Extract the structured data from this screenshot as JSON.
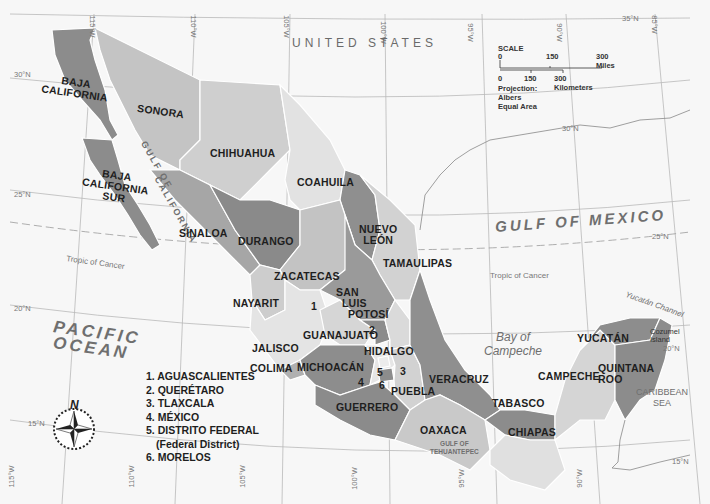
{
  "map": {
    "country_label": "UNITED STATES",
    "water_bodies": {
      "pacific": "PACIFIC OCEAN",
      "pacific_line1": "PACIFIC",
      "pacific_line2": "OCEAN",
      "gulf_mexico": "GULF OF MEXICO",
      "gulf_california_1": "GULF OF",
      "gulf_california_2": "CALIFORNIA",
      "bay_campeche_1": "Bay of",
      "bay_campeche_2": "Campeche",
      "caribbean_1": "CARIBBEAN",
      "caribbean_2": "SEA",
      "tehuantepec_1": "GULF OF",
      "tehuantepec_2": "TEHUANTEPEC",
      "yucatan_channel": "Yucatán Channel",
      "cozumel_1": "Cozumel",
      "cozumel_2": "Island"
    },
    "states": {
      "baja_california_1": "BAJA",
      "baja_california_2": "CALIFORNIA",
      "baja_california_sur_1": "BAJA",
      "baja_california_sur_2": "CALIFORNIA",
      "baja_california_sur_3": "SUR",
      "sonora": "SONORA",
      "chihuahua": "CHIHUAHUA",
      "coahuila": "COAHUILA",
      "nuevo_leon_1": "NUEVO",
      "nuevo_leon_2": "LEÓN",
      "tamaulipas": "TAMAULIPAS",
      "sinaloa": "SINALOA",
      "durango": "DURANGO",
      "zacatecas": "ZACATECAS",
      "san_luis_potosi_1": "SAN",
      "san_luis_potosi_2": "LUIS",
      "san_luis_potosi_3": "POTOSÍ",
      "nayarit": "NAYARIT",
      "jalisco": "JALISCO",
      "colima": "COLIMA",
      "guanajuato": "GUANAJUATO",
      "hidalgo": "HIDALGO",
      "michoacan": "MICHOACÁN",
      "veracruz": "VERACRUZ",
      "puebla": "PUEBLA",
      "guerrero": "GUERRERO",
      "oaxaca": "OAXACA",
      "tabasco": "TABASCO",
      "chiapas": "CHIAPAS",
      "campeche": "CAMPECHE",
      "yucatan": "YUCATÁN",
      "quintana_roo_1": "QUINTANA",
      "quintana_roo_2": "ROO"
    },
    "numbered_markers": [
      "1",
      "2",
      "3",
      "4",
      "5",
      "6"
    ],
    "legend": [
      "1. AGUASCALIENTES",
      "2. QUERÉTARO",
      "3. TLAXCALA",
      "4. MÉXICO",
      "5. DISTRITO FEDERAL",
      "(Federal District)",
      "6. MORELOS"
    ],
    "lines": {
      "tropic_of_cancer": "Tropic of Cancer"
    },
    "graticule": {
      "lat_35": "35°N",
      "lat_30": "30°N",
      "lat_25": "25°N",
      "lat_20": "20°N",
      "lat_15": "15°N",
      "lon_115": "115°W",
      "lon_110": "110°W",
      "lon_105": "105°W",
      "lon_100": "100°W",
      "lon_95": "95°W",
      "lon_90": "90°W",
      "lon_85": "85°W"
    },
    "scale": {
      "title": "SCALE",
      "miles": [
        "0",
        "150",
        "300 Miles"
      ],
      "km": [
        "0",
        "150",
        "300 Kilometers"
      ],
      "projection": "Projection: Albers Equal Area"
    },
    "compass": {
      "north": "N"
    },
    "colors": {
      "water": "#f7f7f7",
      "dark_state": "#8c8c8c",
      "mid_state": "#a9a9a9",
      "light_state": "#c9c9c9",
      "pale_state": "#e0e0e0",
      "border": "#ffffff"
    }
  }
}
